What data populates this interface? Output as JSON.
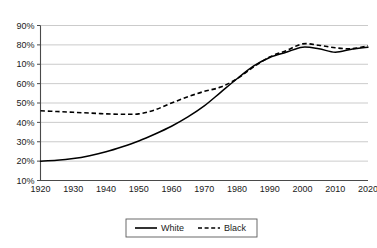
{
  "chart_data": {
    "type": "line",
    "title": "",
    "subtitle": "",
    "xlabel": "",
    "ylabel": "",
    "grid": true,
    "legend_position": "bottom-center",
    "xlim": [
      1920,
      2020
    ],
    "ylim": [
      10,
      90
    ],
    "x_ticks": [
      1920,
      1930,
      1940,
      1950,
      1960,
      1970,
      1980,
      1990,
      2000,
      2010,
      2020
    ],
    "x_tick_labels": [
      "1920",
      "1930",
      "1940",
      "1950",
      "1960",
      "1970",
      "1980",
      "1990",
      "2000",
      "2010",
      "2020"
    ],
    "y_ticks": [
      90,
      80,
      70,
      60,
      50,
      40,
      30,
      20,
      10
    ],
    "y_tick_labels": [
      "90%",
      "80%",
      "10%",
      "60%",
      "50%",
      "40%",
      "30%",
      "20%",
      "10%"
    ],
    "x": [
      1920,
      1925,
      1930,
      1935,
      1940,
      1945,
      1950,
      1955,
      1960,
      1965,
      1970,
      1975,
      1980,
      1985,
      1990,
      1995,
      2000,
      2005,
      2010,
      2015,
      2020
    ],
    "series": [
      {
        "name": "White",
        "style": "solid",
        "color": "#000000",
        "values": [
          20,
          20.4,
          21.3,
          22.8,
          24.8,
          27.4,
          30.4,
          34.0,
          38.0,
          42.8,
          48.5,
          55.5,
          62.5,
          69.0,
          73.5,
          76.2,
          78.8,
          78.0,
          76.2,
          77.8,
          78.8
        ]
      },
      {
        "name": "Black",
        "style": "dashed",
        "color": "#000000",
        "values": [
          46,
          45.6,
          45.2,
          44.8,
          44.4,
          44.2,
          44.4,
          46.5,
          50.0,
          53.2,
          56.0,
          58.2,
          62.5,
          68.5,
          73.8,
          77.0,
          80.5,
          79.8,
          78.5,
          78.0,
          79.5
        ]
      }
    ]
  },
  "legend": {
    "entries": [
      {
        "label": "White",
        "style": "solid"
      },
      {
        "label": "Black",
        "style": "dashed"
      }
    ]
  }
}
